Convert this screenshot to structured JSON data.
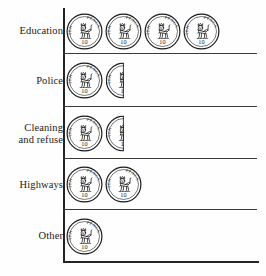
{
  "chart_data": {
    "type": "bar",
    "subtype": "pictogram",
    "title": "",
    "subtitle": "",
    "xlabel": "",
    "ylabel": "",
    "unit_symbol": "ten-pence-coin",
    "unit_value": 10,
    "unit_label": "TEN PENCE",
    "legend": [],
    "grid": false,
    "orientation": "horizontal",
    "categories": [
      "Education",
      "Police",
      "Cleaning and refuse",
      "Highways",
      "Other"
    ],
    "values": [
      4,
      1.5,
      1.5,
      2,
      1
    ],
    "xlim": [
      0,
      5
    ],
    "axis_color": "#242424",
    "ink_color": "#1b1b1b"
  },
  "rows": [
    {
      "label": "Education",
      "label_lines": "Education",
      "value": 4,
      "full_coins": 4,
      "half_coins": 0,
      "separator": true
    },
    {
      "label": "Police",
      "label_lines": "Police",
      "value": 1.5,
      "full_coins": 1,
      "half_coins": 1,
      "separator": true
    },
    {
      "label": "Cleaning and refuse",
      "label_lines": "Cleaning\nand refuse",
      "value": 1.5,
      "full_coins": 1,
      "half_coins": 1,
      "separator": true
    },
    {
      "label": "Highways",
      "label_lines": "Highways",
      "value": 2,
      "full_coins": 2,
      "half_coins": 0,
      "separator": true
    },
    {
      "label": "Other",
      "label_lines": "Other",
      "value": 1,
      "full_coins": 1,
      "half_coins": 0,
      "separator": false
    }
  ],
  "coin": {
    "rim_text_left": "TEN",
    "rim_text_right": "PENCE",
    "denomination": "10",
    "motif": "crowned-lion-passant"
  }
}
